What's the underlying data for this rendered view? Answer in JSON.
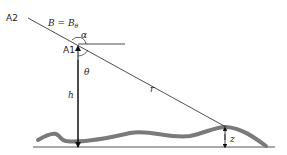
{
  "diagram": {
    "labels": {
      "a2": "A2",
      "a1": "A1",
      "b_eq": "B = B",
      "b_sub": "θ",
      "alpha": "α",
      "theta": "θ",
      "h": "h",
      "r": "r",
      "z": "z"
    },
    "colors": {
      "line": "#222222",
      "terrain": "#7a7a7a",
      "baseline": "#555555"
    }
  }
}
